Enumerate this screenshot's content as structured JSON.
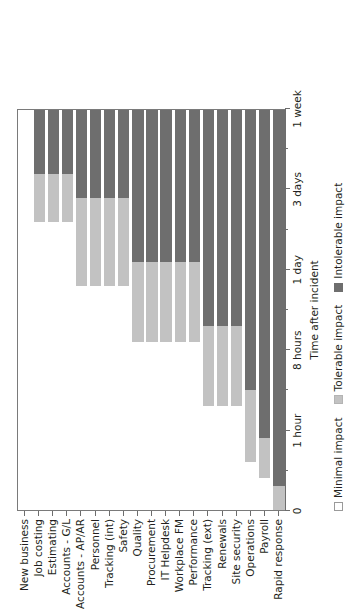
{
  "chart_data": {
    "type": "bar",
    "orientation": "horizontal-rotated",
    "stacked": true,
    "title": "",
    "xlabel": "Time after incident",
    "ylabel": "",
    "grid": false,
    "legend_position": "bottom",
    "axis": {
      "tick_labels": [
        "0",
        "1 hour",
        "8 hours",
        "1 day",
        "3 days",
        "1 week"
      ],
      "tick_fractions": [
        0,
        0.2,
        0.4,
        0.6,
        0.8,
        1.0
      ],
      "range_label_min": "0",
      "range_label_max": "1 week"
    },
    "series": [
      {
        "name": "Minimal impact",
        "color": "#ffffff"
      },
      {
        "name": "Tolerable impact",
        "color": "#c2c2c2"
      },
      {
        "name": "Intolerable impact",
        "color": "#6e6e6e"
      }
    ],
    "categories": [
      "New business",
      "Job costing",
      "Estimating",
      "Accounts - G/L",
      "Accounts - AP/AR",
      "Personnel",
      "Tracking (int)",
      "Safety",
      "Quality",
      "Procurement",
      "IT Helpdesk",
      "Workplace FM",
      "Performance",
      "Tracking (ext)",
      "Renewals",
      "Site security",
      "Operations",
      "Payroll",
      "Rapid response"
    ],
    "values": {
      "minimal": [
        1.0,
        0.72,
        0.72,
        0.72,
        0.56,
        0.56,
        0.56,
        0.56,
        0.42,
        0.42,
        0.42,
        0.42,
        0.42,
        0.26,
        0.26,
        0.26,
        0.12,
        0.08,
        0.0
      ],
      "tolerable": [
        0.0,
        0.12,
        0.12,
        0.12,
        0.22,
        0.22,
        0.22,
        0.22,
        0.2,
        0.2,
        0.2,
        0.2,
        0.2,
        0.2,
        0.2,
        0.2,
        0.18,
        0.1,
        0.06
      ],
      "intolerable": [
        0.0,
        0.16,
        0.16,
        0.16,
        0.22,
        0.22,
        0.22,
        0.22,
        0.38,
        0.38,
        0.38,
        0.38,
        0.38,
        0.54,
        0.54,
        0.54,
        0.7,
        0.82,
        0.94
      ]
    }
  },
  "legend": {
    "items": [
      {
        "label": "Minimal impact"
      },
      {
        "label": "Tolerable impact"
      },
      {
        "label": "Intolerable impact"
      }
    ]
  }
}
